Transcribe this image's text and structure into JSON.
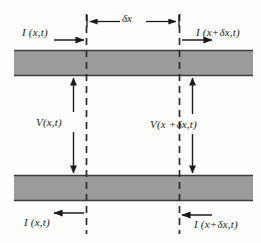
{
  "figure": {
    "name": "transmission-line-element-diagram",
    "type": "schematic",
    "colors": {
      "conductor_fill": "#9b9b9b",
      "conductor_edge": "#3d3d3d",
      "line": "#1b1b1b",
      "dashed": "#2a2a2a",
      "background": "#fdfdfc"
    },
    "labels": {
      "current_left_top": "I (x,t)",
      "current_right_top": "I (x+δx,t)",
      "current_left_bottom": "I (x,t)",
      "current_right_bottom": "I (x+δx,t)",
      "voltage_left": "V(x,t)",
      "voltage_right": "V(x +δx,t)",
      "length_element": "δx"
    },
    "elements": {
      "top_conductor": "top-conductor-bar",
      "bottom_conductor": "bottom-conductor-bar",
      "left_boundary": "left-dashed-boundary",
      "right_boundary": "right-dashed-boundary",
      "dimension_line": "delta-x-dimension-line",
      "voltage_arrow_left": "left-voltage-double-arrow",
      "voltage_arrow_right": "right-voltage-double-arrow",
      "current_arrow_top_left": "top-left-current-arrow",
      "current_arrow_top_right": "top-right-current-arrow",
      "current_arrow_bottom_left": "bottom-left-current-arrow",
      "current_arrow_bottom_right": "bottom-right-current-arrow"
    }
  }
}
